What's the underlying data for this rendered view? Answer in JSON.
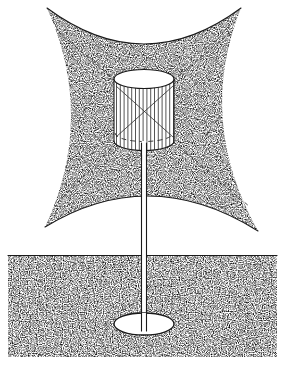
{
  "figure": {
    "domain_kind": "technical-line-illustration",
    "background_color": "#ffffff",
    "ink_color": "#1a1a1a",
    "stipple_color": "#333333",
    "canvas": {
      "width": 287,
      "height": 369
    }
  },
  "coverage_field": {
    "name": "upper-stippled-field",
    "shape": "concave-sided-quadrilateral",
    "fill_style": "stipple",
    "corners": [
      {
        "label": "top-left",
        "x": 47,
        "y": 8
      },
      {
        "label": "top-right",
        "x": 241,
        "y": 8
      },
      {
        "label": "bottom-right",
        "x": 258,
        "y": 231
      },
      {
        "label": "bottom-left",
        "x": 45,
        "y": 227
      }
    ],
    "edges": [
      {
        "label": "top-edge",
        "curvature": "concave-down-toward-center",
        "control_x": 144,
        "control_y": 80
      },
      {
        "label": "right-edge",
        "curvature": "concave-left-toward-center",
        "control_x": 196,
        "control_y": 120
      },
      {
        "label": "bottom-edge",
        "curvature": "concave-up-toward-center",
        "control_x": 150,
        "control_y": 163
      },
      {
        "label": "left-edge",
        "curvature": "concave-right-toward-center",
        "control_x": 96,
        "control_y": 118
      }
    ]
  },
  "ground_layer": {
    "name": "ground-stipple-block",
    "shape": "rectangle",
    "x": 8,
    "y": 255,
    "width": 269,
    "height": 102,
    "top_edge_line": true,
    "fill_style": "stipple"
  },
  "cylinder": {
    "name": "caged-cylinder-body",
    "center_x": 144,
    "top_ellipse": {
      "cx": 144,
      "cy": 79,
      "rx": 30,
      "ry": 9.5
    },
    "bottom_ellipse": {
      "cx": 144,
      "cy": 141,
      "rx": 30,
      "ry": 9.5
    },
    "hidden_ellipse": {
      "cx": 144,
      "cy": 133,
      "rx": 29,
      "ry": 8.5,
      "style": "dashed"
    },
    "height": 62,
    "vertical_bar_count": 17,
    "has_diagonal_cross": true,
    "cross_style": "solid-thin"
  },
  "pole": {
    "name": "support-pole",
    "x_left": 141,
    "x_right": 147,
    "y_top": 141,
    "y_bottom": 330,
    "fill": "#ffffff",
    "edge_lines": 2
  },
  "base_plate": {
    "name": "buried-base-plate",
    "cx": 144,
    "cy": 324,
    "rx": 30,
    "ry": 11,
    "fill": "#ffffff"
  },
  "radial_rays": {
    "name": "dashed-coverage-rays",
    "style": "dashed",
    "count": 4,
    "origin": {
      "x": 144,
      "y": 110
    },
    "rays": [
      {
        "label": "ray-upper-left",
        "x1": 122,
        "y1": 86,
        "x2": 56,
        "y2": 30
      },
      {
        "label": "ray-upper-right",
        "x1": 167,
        "y1": 86,
        "x2": 232,
        "y2": 31
      },
      {
        "label": "ray-lower-right",
        "x1": 168,
        "y1": 137,
        "x2": 250,
        "y2": 207
      },
      {
        "label": "ray-lower-left",
        "x1": 121,
        "y1": 139,
        "x2": 55,
        "y2": 205
      }
    ]
  },
  "cross_lines": {
    "name": "cylinder-interior-cross",
    "lines": [
      {
        "label": "cross-a",
        "x1": 118,
        "y1": 88,
        "x2": 171,
        "y2": 135
      },
      {
        "label": "cross-b",
        "x1": 171,
        "y1": 88,
        "x2": 118,
        "y2": 135
      }
    ]
  }
}
